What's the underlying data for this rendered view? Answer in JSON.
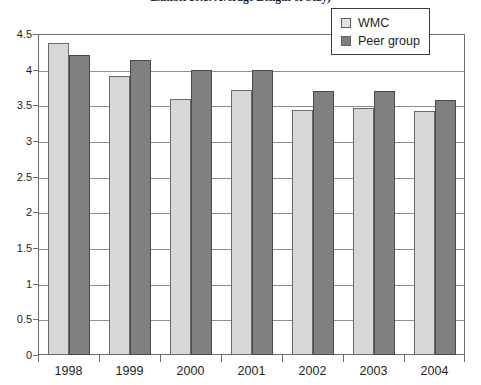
{
  "chart_data": {
    "type": "bar",
    "title": "Exhibit 10.1: Average Length of Stay)",
    "xlabel": "",
    "ylabel": "",
    "ylim": [
      0,
      4.5
    ],
    "yticks": [
      "0",
      "0.5",
      "1",
      "1.5",
      "2",
      "2.5",
      "3",
      "3.5",
      "4",
      "4.5"
    ],
    "ytick_values": [
      0,
      0.5,
      1,
      1.5,
      2,
      2.5,
      3,
      3.5,
      4,
      4.5
    ],
    "grid": true,
    "legend_position": "top-right",
    "categories": [
      "1998",
      "1999",
      "2000",
      "2001",
      "2002",
      "2003",
      "2004"
    ],
    "series": [
      {
        "name": "WMC",
        "color": "#d7d7d7",
        "values": [
          4.38,
          3.91,
          3.59,
          3.71,
          3.43,
          3.46,
          3.42
        ]
      },
      {
        "name": "Peer group",
        "color": "#808080",
        "values": [
          4.2,
          4.14,
          3.99,
          3.99,
          3.7,
          3.7,
          3.57
        ]
      }
    ]
  },
  "legend": {
    "items": [
      {
        "label": "WMC",
        "swatch": "wmc"
      },
      {
        "label": "Peer group",
        "swatch": "peer"
      }
    ]
  }
}
